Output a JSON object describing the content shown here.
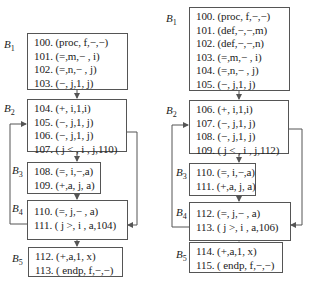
{
  "left_flowgraph": {
    "blocks": [
      {
        "label": "B",
        "sub": "1",
        "lines": [
          "100. (proc, f,−,−)",
          "101. (=,m,− , i)",
          "102. (=,n,− , j)",
          "103. (−, j,1, j)"
        ]
      },
      {
        "label": "B",
        "sub": "2",
        "lines": [
          "104. (+, i,1,i)",
          "105. (−, j,1, j)",
          "106. (−, j,1, j)",
          "107. ( j < , i , j,110)"
        ]
      },
      {
        "label": "B",
        "sub": "3",
        "lines": [
          "108. (=, i,−,a)",
          "109. (+,a, j, a)"
        ]
      },
      {
        "label": "B",
        "sub": "4",
        "lines": [
          "110. (=, j,− , a)",
          "111. ( j >, i , a,104)"
        ]
      },
      {
        "label": "B",
        "sub": "5",
        "lines": [
          "112. (+,a,1, x)",
          "113. ( endp, f,−,−)"
        ]
      }
    ]
  },
  "right_flowgraph": {
    "blocks": [
      {
        "label": "B",
        "sub": "1",
        "lines": [
          "100. (proc, f,−,−)",
          "101. (def,−,−,m)",
          "102. (def,−,−,n)",
          "103. (=,m,− , i)",
          "104. (=,n,− , j)",
          "105. (−, j,1, j)"
        ]
      },
      {
        "label": "B",
        "sub": "2",
        "lines": [
          "106. (+, i,1,i)",
          "107. (−, j,1, j)",
          "108. (−, j,1, j)",
          "109. ( j < , i , j,112)"
        ]
      },
      {
        "label": "B",
        "sub": "3",
        "lines": [
          "110. (=, i,−,a)",
          "111. (+,a, j, a)"
        ]
      },
      {
        "label": "B",
        "sub": "4",
        "lines": [
          "112. (=, j,− , a)",
          "113. ( j >, i , a,106)"
        ]
      },
      {
        "label": "B",
        "sub": "5",
        "lines": [
          "114. (+,a,1, x)",
          "115. ( endp, f,−,−)"
        ]
      }
    ]
  },
  "colors": {
    "line": "#555555",
    "text": "#222222",
    "background": "#ffffff"
  }
}
